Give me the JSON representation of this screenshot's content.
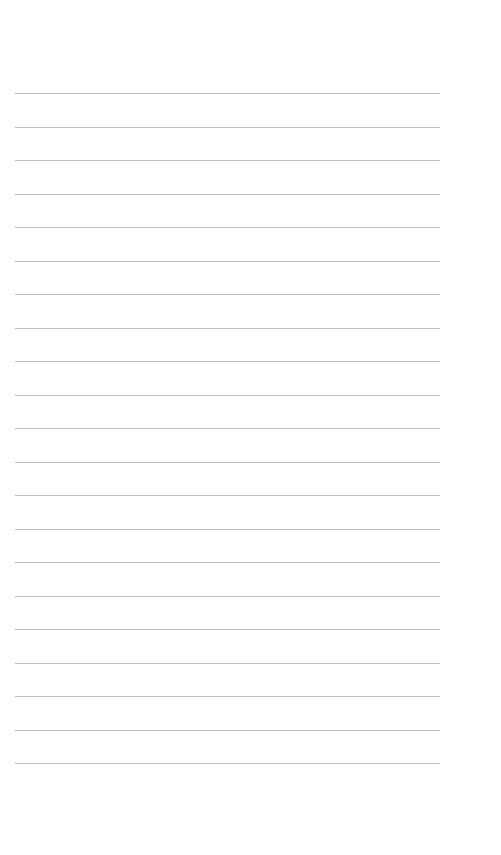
{
  "page": {
    "type": "lined-paper",
    "background_color": "#ffffff",
    "line_color": "#bdbdbd",
    "line_count": 21,
    "first_line_y": 93,
    "line_spacing": 33.5,
    "line_left": 15,
    "line_width": 425
  },
  "header": {
    "bleed_text": ""
  }
}
